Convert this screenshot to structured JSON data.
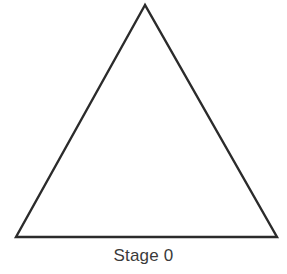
{
  "diagram": {
    "title": "Stage 0",
    "shape": "triangle-icon",
    "stroke_color": "#2b2b2b",
    "fill_color": "#ffffff",
    "vertices": {
      "apex": [
        145,
        5
      ],
      "bottom_left": [
        16,
        237
      ],
      "bottom_right": [
        277,
        237
      ]
    }
  }
}
